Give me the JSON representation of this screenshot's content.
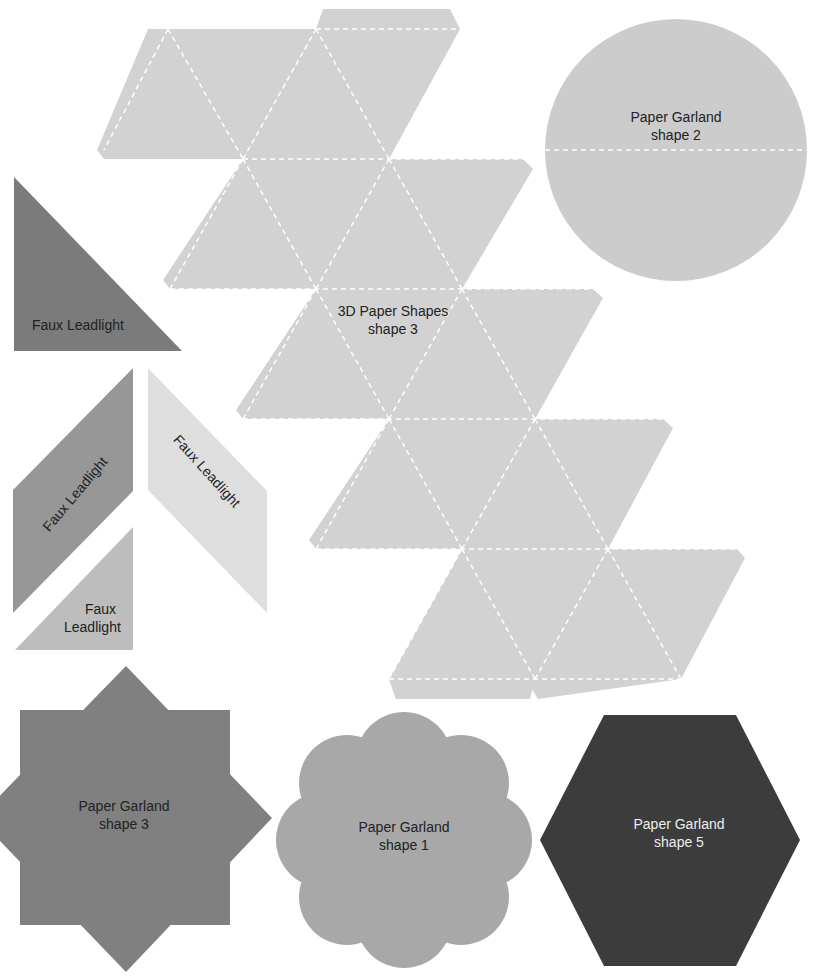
{
  "colors": {
    "net": "#d2d2d2",
    "circle": "#cccccc",
    "dark_triangle": "#7b7b7b",
    "mid_parallelogram": "#979797",
    "light_parallelogram": "#dedede",
    "small_triangle": "#bdbdbd",
    "star": "#808080",
    "flower": "#a8a8a8",
    "hexagon": "#3c3c3c",
    "fold_line": "#ffffff"
  },
  "shapes": {
    "net": {
      "label_line1": "3D Paper Shapes",
      "label_line2": "shape 3"
    },
    "circle": {
      "label_line1": "Paper Garland",
      "label_line2": "shape 2"
    },
    "triangle_dark": {
      "label": "Faux Leadlight"
    },
    "parallelogram_mid": {
      "label": "Faux Leadlight"
    },
    "parallelogram_light": {
      "label": "Faux Leadlight"
    },
    "triangle_small": {
      "label_line1": "Faux",
      "label_line2": "Leadlight"
    },
    "star": {
      "label_line1": "Paper Garland",
      "label_line2": "shape 3"
    },
    "flower": {
      "label_line1": "Paper Garland",
      "label_line2": "shape 1"
    },
    "hexagon": {
      "label_line1": "Paper Garland",
      "label_line2": "shape 5"
    }
  }
}
